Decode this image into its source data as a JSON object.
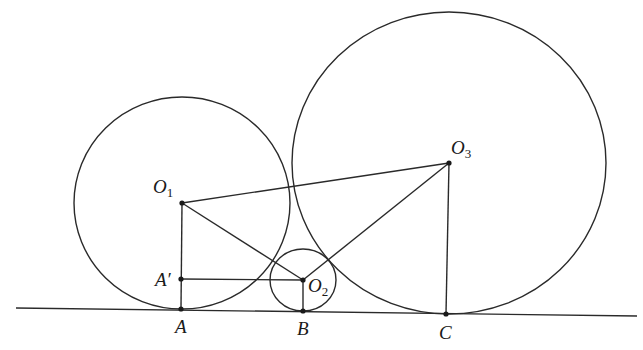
{
  "diagram": {
    "title_fragment": "",
    "colors": {
      "stroke": "#2a2a2a",
      "background": "#ffffff"
    },
    "ground_line": {
      "x1": 16,
      "y1": 308,
      "x2": 637,
      "y2": 316
    },
    "circles": [
      {
        "name": "O1",
        "cx": 182,
        "cy": 203,
        "rx": 108,
        "ry": 106
      },
      {
        "name": "O2",
        "cx": 303,
        "cy": 280,
        "rx": 33,
        "ry": 31
      },
      {
        "name": "O3",
        "cx": 449,
        "cy": 163,
        "rx": 157,
        "ry": 151
      }
    ],
    "points": {
      "O1": {
        "x": 182,
        "y": 203
      },
      "O2": {
        "x": 303,
        "y": 280
      },
      "O3": {
        "x": 449,
        "y": 163
      },
      "A_prime": {
        "x": 181,
        "y": 279
      },
      "A": {
        "x": 181,
        "y": 309
      },
      "B": {
        "x": 303,
        "y": 311
      },
      "C": {
        "x": 446,
        "y": 314
      }
    },
    "labels": {
      "O1": {
        "main": "O",
        "sub": "1"
      },
      "O2": {
        "main": "O",
        "sub": "2"
      },
      "O3": {
        "main": "O",
        "sub": "3"
      },
      "A_prime": "A′",
      "A": "A",
      "B": "B",
      "C": "C"
    }
  }
}
